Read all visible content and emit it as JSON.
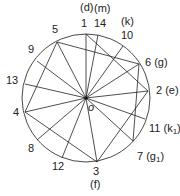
{
  "diagram": {
    "circle": {
      "cx": 86,
      "cy": 98,
      "r": 64
    },
    "center_label": "o",
    "points": [
      {
        "id": "1",
        "x": 86,
        "y": 34,
        "label": "1",
        "sub": "(d)"
      },
      {
        "id": "14",
        "x": 98,
        "y": 35,
        "label": "14",
        "sub": "(m)"
      },
      {
        "id": "10",
        "x": 123,
        "y": 46,
        "label": "10",
        "sub": "(k)"
      },
      {
        "id": "6",
        "x": 139,
        "y": 64,
        "label": "6 (g)",
        "sub": ""
      },
      {
        "id": "2",
        "x": 148,
        "y": 91,
        "label": "2 (e)",
        "sub": ""
      },
      {
        "id": "11",
        "x": 145,
        "y": 119,
        "label": "11 (k1)",
        "sub": ""
      },
      {
        "id": "7",
        "x": 133,
        "y": 141,
        "label": "7 (g1)",
        "sub": ""
      },
      {
        "id": "3",
        "x": 97,
        "y": 162,
        "label": "3",
        "sub": "(f)"
      },
      {
        "id": "12",
        "x": 62,
        "y": 158,
        "label": "12",
        "sub": ""
      },
      {
        "id": "8",
        "x": 37,
        "y": 140,
        "label": "8",
        "sub": ""
      },
      {
        "id": "4",
        "x": 25,
        "y": 112,
        "label": "4",
        "sub": ""
      },
      {
        "id": "13",
        "x": 25,
        "y": 84,
        "label": "13",
        "sub": ""
      },
      {
        "id": "9",
        "x": 37,
        "y": 61,
        "label": "9",
        "sub": ""
      },
      {
        "id": "5",
        "x": 57,
        "y": 42,
        "label": "5",
        "sub": ""
      }
    ],
    "chords": [
      [
        "5",
        "6"
      ],
      [
        "1",
        "2"
      ],
      [
        "6",
        "7"
      ],
      [
        "2",
        "3"
      ],
      [
        "5",
        "4"
      ],
      [
        "4",
        "3"
      ]
    ]
  }
}
